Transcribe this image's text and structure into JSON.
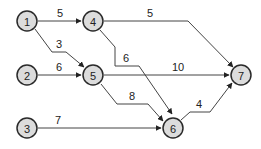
{
  "diagram": {
    "type": "directed-network",
    "nodes": [
      {
        "id": "1",
        "label": "1",
        "x": 27,
        "y": 21
      },
      {
        "id": "2",
        "label": "2",
        "x": 27,
        "y": 75
      },
      {
        "id": "3",
        "label": "3",
        "x": 27,
        "y": 128
      },
      {
        "id": "4",
        "label": "4",
        "x": 93,
        "y": 21
      },
      {
        "id": "5",
        "label": "5",
        "x": 93,
        "y": 75
      },
      {
        "id": "6",
        "label": "6",
        "x": 173,
        "y": 128
      },
      {
        "id": "7",
        "label": "7",
        "x": 241,
        "y": 75
      }
    ],
    "edges": [
      {
        "from": "1",
        "to": "4",
        "weight": "5"
      },
      {
        "from": "1",
        "to": "5",
        "weight": "3"
      },
      {
        "from": "4",
        "to": "7",
        "weight": "5"
      },
      {
        "from": "4",
        "to": "6",
        "weight": "6"
      },
      {
        "from": "2",
        "to": "5",
        "weight": "6"
      },
      {
        "from": "5",
        "to": "7",
        "weight": "10"
      },
      {
        "from": "5",
        "to": "6",
        "weight": "8"
      },
      {
        "from": "3",
        "to": "6",
        "weight": "7"
      },
      {
        "from": "6",
        "to": "7",
        "weight": "4"
      }
    ],
    "colors": {
      "node_fill": "#dcdcdc",
      "node_stroke": "#2a2a2a",
      "edge": "#444444"
    }
  }
}
